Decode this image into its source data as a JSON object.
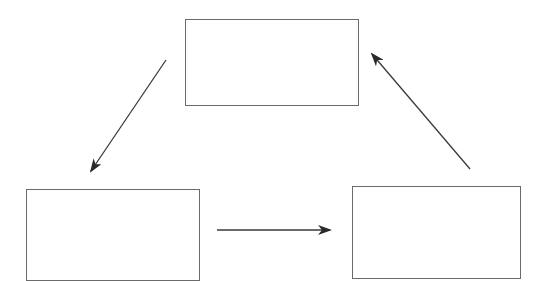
{
  "diagram": {
    "type": "cycle",
    "background": "#ffffff",
    "stroke_color": "#6b6b6b",
    "arrow_color": "#333333",
    "nodes": [
      {
        "id": "top",
        "label": "",
        "x": 185,
        "y": 19,
        "w": 173,
        "h": 86
      },
      {
        "id": "bottom-left",
        "label": "",
        "x": 26,
        "y": 189,
        "w": 173,
        "h": 91
      },
      {
        "id": "bottom-right",
        "label": "",
        "x": 352,
        "y": 186,
        "w": 168,
        "h": 92
      }
    ],
    "edges": [
      {
        "from": "top",
        "to": "bottom-left",
        "x1": 166,
        "y1": 60,
        "x2": 91,
        "y2": 171
      },
      {
        "from": "bottom-left",
        "to": "bottom-right",
        "x1": 217,
        "y1": 230,
        "x2": 330,
        "y2": 230
      },
      {
        "from": "bottom-right",
        "to": "top",
        "x1": 470,
        "y1": 169,
        "x2": 372,
        "y2": 54
      }
    ]
  }
}
